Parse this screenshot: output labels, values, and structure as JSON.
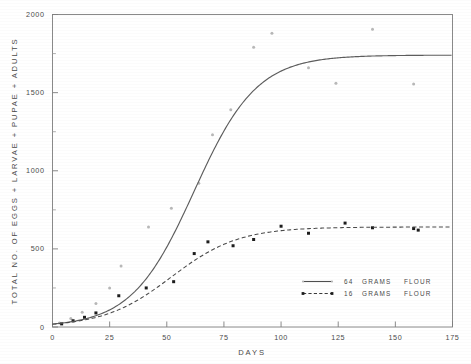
{
  "chart_data": {
    "type": "line",
    "title": "",
    "xlabel": "DAYS",
    "ylabel": "TOTAL NO. OF EGGS + LARVAE + PUPAE + ADULTS",
    "xlim": [
      0,
      175
    ],
    "ylim": [
      0,
      2000
    ],
    "xticks": [
      0,
      25,
      50,
      75,
      100,
      125,
      150,
      175
    ],
    "xticklabels": [
      "0",
      "25",
      "50",
      "75",
      "100",
      "125",
      "150",
      "175"
    ],
    "yticks": [
      0,
      500,
      1000,
      1500,
      2000
    ],
    "yticklabels": [
      "0",
      "500",
      "1000",
      "1500",
      "2000"
    ],
    "yminorticks": [
      250,
      750,
      1250,
      1750
    ],
    "grid": false,
    "legend_position": "lower-right",
    "series": [
      {
        "name": "64 GRAMS FLOUR",
        "style": "solid",
        "marker": "faint-dot",
        "asymptote": 1740,
        "fitted_curve": {
          "model": "logistic",
          "K": 1740,
          "r": 0.073,
          "t0": 62,
          "y0": 18
        },
        "points": [
          {
            "x": 3,
            "y": 25
          },
          {
            "x": 8,
            "y": 55
          },
          {
            "x": 13,
            "y": 95
          },
          {
            "x": 19,
            "y": 150
          },
          {
            "x": 25,
            "y": 250
          },
          {
            "x": 30,
            "y": 390
          },
          {
            "x": 42,
            "y": 640
          },
          {
            "x": 52,
            "y": 760
          },
          {
            "x": 64,
            "y": 920
          },
          {
            "x": 70,
            "y": 1230
          },
          {
            "x": 78,
            "y": 1390
          },
          {
            "x": 88,
            "y": 1790
          },
          {
            "x": 96,
            "y": 1880
          },
          {
            "x": 112,
            "y": 1660
          },
          {
            "x": 124,
            "y": 1560
          },
          {
            "x": 140,
            "y": 1905
          },
          {
            "x": 158,
            "y": 1555
          }
        ]
      },
      {
        "name": "16 GRAMS FLOUR",
        "style": "dashed",
        "marker": "filled-square",
        "asymptote": 640,
        "fitted_curve": {
          "model": "logistic",
          "K": 640,
          "r": 0.068,
          "t0": 52,
          "y0": 12
        },
        "points": [
          {
            "x": 4,
            "y": 20
          },
          {
            "x": 9,
            "y": 40
          },
          {
            "x": 14,
            "y": 62
          },
          {
            "x": 19,
            "y": 90
          },
          {
            "x": 29,
            "y": 200
          },
          {
            "x": 41,
            "y": 250
          },
          {
            "x": 53,
            "y": 290
          },
          {
            "x": 62,
            "y": 470
          },
          {
            "x": 68,
            "y": 545
          },
          {
            "x": 79,
            "y": 520
          },
          {
            "x": 88,
            "y": 560
          },
          {
            "x": 100,
            "y": 645
          },
          {
            "x": 112,
            "y": 600
          },
          {
            "x": 128,
            "y": 665
          },
          {
            "x": 140,
            "y": 635
          },
          {
            "x": 158,
            "y": 630
          },
          {
            "x": 160,
            "y": 620
          }
        ]
      }
    ],
    "legend": [
      {
        "label_value": "64",
        "label_unit": "GRAMS",
        "label_medium": "FLOUR",
        "style": "solid"
      },
      {
        "label_value": "16",
        "label_unit": "GRAMS",
        "label_medium": "FLOUR",
        "style": "dashed"
      }
    ]
  }
}
